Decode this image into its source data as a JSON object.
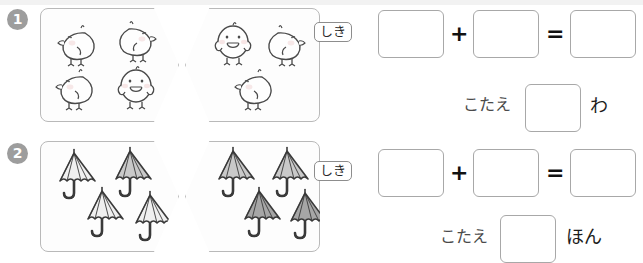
{
  "worksheet": {
    "language": "ja",
    "problems": [
      {
        "number": "❶",
        "number_plain": "1",
        "left_group": {
          "icon": "chick-icon",
          "count": 4,
          "items": [
            {
              "pose": "side-right",
              "x": 14,
              "y": 14
            },
            {
              "pose": "side-left",
              "x": 72,
              "y": 10
            },
            {
              "pose": "side-right",
              "x": 12,
              "y": 58
            },
            {
              "pose": "front",
              "x": 74,
              "y": 56
            }
          ]
        },
        "right_group": {
          "icon": "chick-icon",
          "count": 3,
          "items": [
            {
              "pose": "front",
              "x": 26,
              "y": 12
            },
            {
              "pose": "side-left",
              "x": 76,
              "y": 14
            },
            {
              "pose": "side-right",
              "x": 46,
              "y": 58
            }
          ]
        },
        "shiki_label": "しき",
        "operator_plus": "+",
        "operator_equals": "=",
        "box_values": [
          "",
          "",
          ""
        ],
        "kotae_label": "こたえ",
        "kotae_value": "",
        "unit": "わ"
      },
      {
        "number": "❷",
        "number_plain": "2",
        "left_group": {
          "icon": "umbrella-icon",
          "count": 4,
          "items": [
            {
              "shade": "light",
              "x": 10,
              "y": 6
            },
            {
              "shade": "medium",
              "x": 66,
              "y": 4
            },
            {
              "shade": "light",
              "x": 38,
              "y": 44
            },
            {
              "shade": "light",
              "x": 86,
              "y": 48
            }
          ]
        },
        "right_group": {
          "icon": "umbrella-icon",
          "count": 4,
          "items": [
            {
              "shade": "medium",
              "x": 24,
              "y": 4
            },
            {
              "shade": "medium",
              "x": 78,
              "y": 4
            },
            {
              "shade": "dark",
              "x": 50,
              "y": 44
            },
            {
              "shade": "dark",
              "x": 96,
              "y": 46
            }
          ]
        },
        "shiki_label": "しき",
        "operator_plus": "+",
        "operator_equals": "=",
        "box_values": [
          "",
          "",
          ""
        ],
        "kotae_label": "こたえ",
        "kotae_value": "",
        "unit": "ほん"
      }
    ]
  },
  "colors": {
    "page_background": "#ffffff",
    "panel_border": "#b9b9b9",
    "panel_fill": "#fdfdfd",
    "badge_fill": "#9d9d9d",
    "badge_text": "#ffffff",
    "box_border": "#a8a8a8",
    "ink": "#3b3b3b",
    "chick_outline": "#4a4a4a",
    "chick_fill": "#fefefe",
    "chick_blush": "#f4dede",
    "umbrella_outline": "#3a3a3a",
    "umbrella_light": "#f0f0f0",
    "umbrella_medium": "#c9c9c9",
    "umbrella_dark": "#a6a6a6"
  }
}
